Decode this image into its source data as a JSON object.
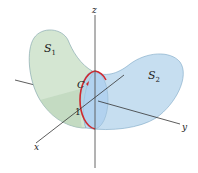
{
  "figure": {
    "axes": {
      "x_label": "x",
      "y_label": "y",
      "z_label": "z"
    },
    "surfaces": [
      {
        "label": "S",
        "subscript": "1",
        "color": "#cfe3cf"
      },
      {
        "label": "S",
        "subscript": "2",
        "color": "#bcd9ef"
      }
    ],
    "curve": {
      "label": "C",
      "color": "#d0282e"
    },
    "tick": {
      "label": "1"
    }
  }
}
